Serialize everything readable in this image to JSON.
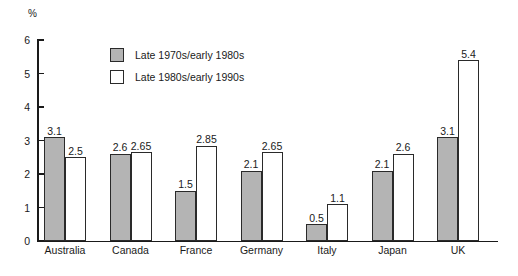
{
  "chart_data": {
    "type": "bar",
    "title": "",
    "subtitle": "",
    "xlabel": "",
    "ylabel": "%",
    "ylim": [
      0,
      6
    ],
    "yticks": [
      "0",
      "1",
      "2",
      "3",
      "4",
      "5",
      "6"
    ],
    "grid": false,
    "legend_position": "top-center",
    "categories": [
      "Australia",
      "Canada",
      "France",
      "Germany",
      "Italy",
      "Japan",
      "UK"
    ],
    "series": [
      {
        "name": "Late 1970s/early 1980s",
        "color": "#b4b4b4",
        "values": [
          3.1,
          2.6,
          1.5,
          2.1,
          0.5,
          2.1,
          3.1
        ],
        "labels": [
          "3.1",
          "2.6",
          "1.5",
          "2.1",
          "0.5",
          "2.1",
          "3.1"
        ]
      },
      {
        "name": "Late 1980s/early 1990s",
        "color": "#ffffff",
        "values": [
          2.5,
          2.65,
          2.85,
          2.65,
          1.1,
          2.6,
          5.4
        ],
        "labels": [
          "2.5",
          "2.65",
          "2.85",
          "2.65",
          "1.1",
          "2.6",
          "5.4"
        ]
      }
    ]
  }
}
